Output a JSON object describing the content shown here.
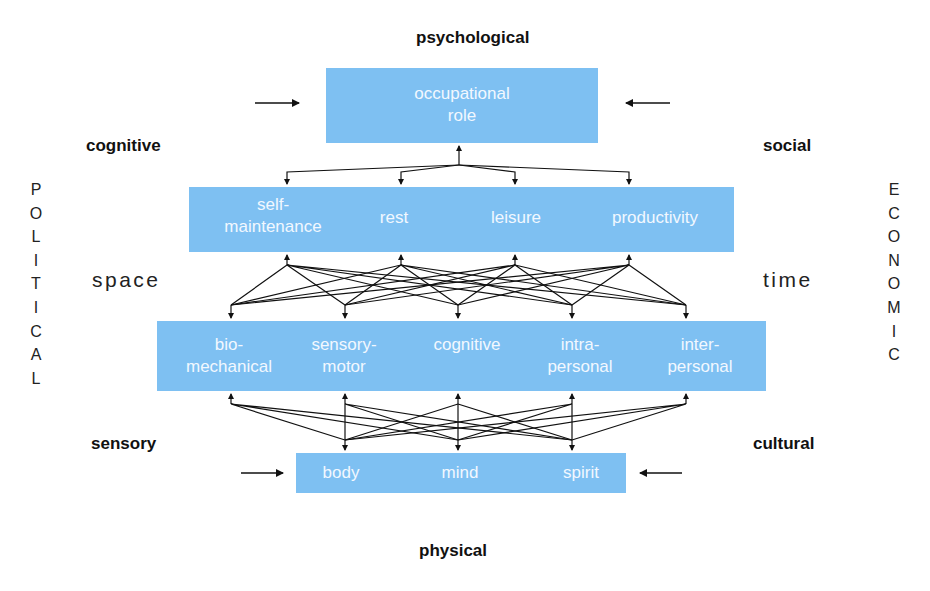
{
  "labels": {
    "top": "psychological",
    "bottom": "physical",
    "upper_left": "cognitive",
    "upper_right": "social",
    "lower_left": "sensory",
    "lower_right": "cultural",
    "mid_left": "space",
    "mid_right": "time"
  },
  "side_columns": {
    "left": [
      "P",
      "O",
      "L",
      "I",
      "T",
      "I",
      "C",
      "A",
      "L"
    ],
    "right": [
      "E",
      "C",
      "O",
      "N",
      "O",
      "M",
      "I",
      "C"
    ]
  },
  "levels": {
    "occupational": {
      "items": [
        "occupational\nrole"
      ]
    },
    "performance": {
      "items": [
        "self-\nmaintenance",
        "rest",
        "leisure",
        "productivity"
      ]
    },
    "components": {
      "items": [
        "bio-\nmechanical",
        "sensory-\nmotor",
        "cognitive",
        "intra-\npersonal",
        "inter-\npersonal"
      ]
    },
    "core": {
      "items": [
        "body",
        "mind",
        "spirit"
      ]
    }
  },
  "colors": {
    "box_fill": "#7ec0f2",
    "box_text": "#f2f8ff",
    "line": "#111111"
  }
}
